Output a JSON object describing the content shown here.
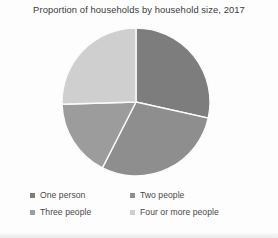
{
  "chart_data": {
    "type": "pie",
    "title": "Proportion of households by household size, 2017",
    "xlabel": "",
    "ylabel": "",
    "legend_position": "bottom",
    "grid": false,
    "categories": [
      "One person",
      "Two people",
      "Three people",
      "Four or more people"
    ],
    "values": [
      28.5,
      29.0,
      17.0,
      25.5
    ],
    "series": [
      {
        "name": "Proportion of households",
        "values": [
          28.5,
          29.0,
          17.0,
          25.5
        ]
      }
    ],
    "slices": [
      {
        "label": "One person",
        "value": 28.5,
        "color": "#7d7d7d",
        "start_angle": 0,
        "end_angle": 102.6
      },
      {
        "label": "Two people",
        "value": 29.0,
        "color": "#8e8e8e",
        "start_angle": 102.6,
        "end_angle": 207.0
      },
      {
        "label": "Three people",
        "value": 17.0,
        "color": "#9c9c9c",
        "start_angle": 207.0,
        "end_angle": 268.2
      },
      {
        "label": "Four or more people",
        "value": 25.5,
        "color": "#cfcfcf",
        "start_angle": 268.2,
        "end_angle": 360
      }
    ]
  },
  "chart": {
    "title": "Proportion of households by household size, 2017"
  },
  "legend": {
    "items": [
      {
        "label": "One person",
        "color": "#7d7d7d"
      },
      {
        "label": "Two people",
        "color": "#8e8e8e"
      },
      {
        "label": "Three people",
        "color": "#9c9c9c"
      },
      {
        "label": "Four or more people",
        "color": "#cfcfcf"
      }
    ]
  },
  "style": {
    "slice_border": "#fbfbfb",
    "background": "#fdfdfd",
    "title_color": "#3b3b3b",
    "label_color": "#4a4a4a"
  }
}
